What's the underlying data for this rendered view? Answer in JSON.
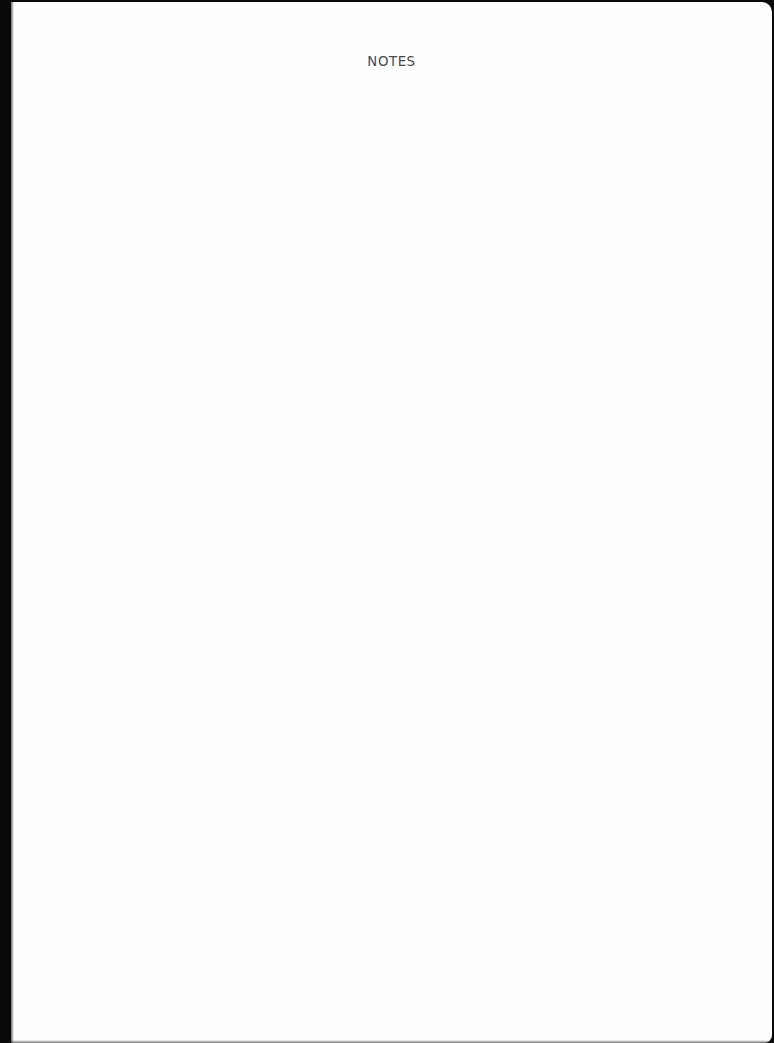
{
  "page": {
    "title": "NOTES",
    "body_lines": []
  },
  "colors": {
    "paper": "#fefefe",
    "scan_border": "#0a0a0a",
    "title_text": "#4a4a4a"
  }
}
